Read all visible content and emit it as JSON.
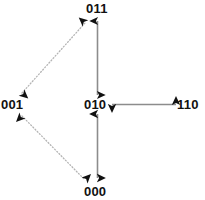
{
  "figure": {
    "type": "state-transition-diagram",
    "background_color": "#ffffff",
    "solid_edge_color": "#8c8c8c",
    "dotted_edge_color": "#b4b4b4",
    "arrowhead_color": "#111111",
    "label_color": "#111111"
  },
  "nodes": [
    {
      "id": "n011",
      "label": "011",
      "x": 98,
      "y": 8
    },
    {
      "id": "n001",
      "label": "001",
      "x": 14,
      "y": 104
    },
    {
      "id": "n010",
      "label": "010",
      "x": 97,
      "y": 104
    },
    {
      "id": "n110",
      "label": "110",
      "x": 190,
      "y": 104
    },
    {
      "id": "n000",
      "label": "000",
      "x": 97,
      "y": 191
    }
  ],
  "edges": [
    {
      "id": "e-011-010",
      "from": "011",
      "to": "010",
      "style": "solid",
      "arrows": "both",
      "orientation": "vertical"
    },
    {
      "id": "e-010-000",
      "from": "010",
      "to": "000",
      "style": "solid",
      "arrows": "both",
      "orientation": "vertical"
    },
    {
      "id": "e-010-110",
      "from": "010",
      "to": "110",
      "style": "solid",
      "arrows": "both",
      "orientation": "horizontal"
    },
    {
      "id": "e-001-011",
      "from": "001",
      "to": "011",
      "style": "dotted",
      "arrows": "both",
      "orientation": "diagonal"
    },
    {
      "id": "e-001-000",
      "from": "001",
      "to": "000",
      "style": "dotted",
      "arrows": "both",
      "orientation": "diagonal"
    }
  ]
}
